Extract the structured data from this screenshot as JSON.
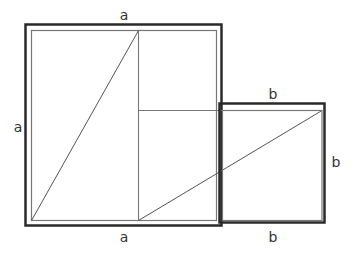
{
  "diagram": {
    "colors": {
      "thick_stroke": "#2a2a2a",
      "thin_stroke": "#6e6e6e",
      "diagonal": "#555555",
      "label": "#333333",
      "background": "#ffffff"
    },
    "labels": {
      "big_top": "a",
      "big_left": "a",
      "big_bottom": "a",
      "small_top": "b",
      "small_right": "b",
      "small_bottom": "b"
    },
    "shapes": {
      "big_square": {
        "side": "a",
        "outer": [
          25,
          24,
          222,
          226
        ],
        "inner": [
          31,
          30,
          216,
          220
        ]
      },
      "small_square": {
        "side": "b",
        "outer": [
          219,
          103,
          325,
          223
        ],
        "inner": [
          222,
          110,
          322,
          220
        ]
      },
      "divider_vertical": {
        "x": 138,
        "y1": 30,
        "y2": 220
      },
      "divider_horizontal": {
        "y": 110,
        "x1": 138,
        "x2": 322
      },
      "diagonal_left": {
        "from": [
          31,
          220
        ],
        "to": [
          138,
          30
        ]
      },
      "diagonal_right": {
        "from": [
          138,
          220
        ],
        "to": [
          322,
          110
        ]
      }
    }
  }
}
